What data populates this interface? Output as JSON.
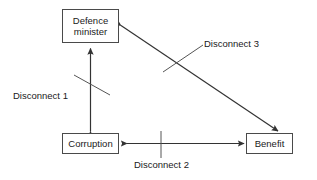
{
  "diagram": {
    "background_color": "#ffffff",
    "line_color": "#333333",
    "box_border_color": "#4a4a4a",
    "text_color": "#1a1a1a",
    "nodes": [
      {
        "id": "defence-minister",
        "line1": "Defence",
        "line2": "minister"
      },
      {
        "id": "corruption",
        "line1": "Corruption",
        "line2": ""
      },
      {
        "id": "benefit",
        "line1": "Benefit",
        "line2": ""
      }
    ],
    "edges": [
      {
        "id": "disconnect-1",
        "label": "Disconnect 1",
        "from": "corruption",
        "to": "defence-minister",
        "arrow": "double",
        "orientation": "vertical",
        "crossed": true
      },
      {
        "id": "disconnect-2",
        "label": "Disconnect 2",
        "from": "corruption",
        "to": "benefit",
        "arrow": "double",
        "orientation": "horizontal",
        "crossed": true
      },
      {
        "id": "disconnect-3",
        "label": "Disconnect 3",
        "from": "defence-minister",
        "to": "benefit",
        "arrow": "double",
        "orientation": "diagonal",
        "crossed": true
      }
    ]
  }
}
